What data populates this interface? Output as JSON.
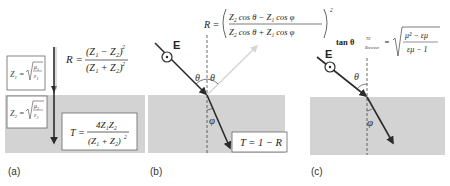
{
  "panels": {
    "a": {
      "label": "(a)",
      "z1_lhs": "Z",
      "z1_sub": "1",
      "z1_num": "μ",
      "z1_num_sub": "1",
      "z1_den": "ε",
      "z1_den_sub": "1",
      "z2_lhs": "Z",
      "z2_sub": "2",
      "z2_num": "μ",
      "z2_num_sub": "2",
      "z2_den": "ε",
      "z2_den_sub": "2",
      "r_lhs": "R =",
      "r_num": "(Z₁ − Z₂)",
      "r_den": "(Z₁ + Z₂)",
      "r_exp": "2",
      "t_lhs": "T =",
      "t_num": "4Z₁Z₂",
      "t_den": "(Z₁ + Z₂)",
      "t_exp": "2"
    },
    "b": {
      "label": "(b)",
      "e_label": "E",
      "theta_left": "θ",
      "theta_right": "θ",
      "phi": "φ",
      "r_lhs": "R =",
      "r_num": "Z₂ cos θ − Z₁ cos φ",
      "r_den": "Z₂ cos θ + Z₁ cos φ",
      "r_exp": "2",
      "t_text": "T = 1 − R"
    },
    "c": {
      "label": "(c)",
      "e_label": "E",
      "theta": "θ",
      "phi": "φ",
      "brewster_lhs": "tan θ",
      "brewster_sup": "TE",
      "brewster_sub": "Brewster",
      "brewster_eq": "=",
      "brewster_num": "μ² − εμ",
      "brewster_den": "εμ − 1"
    }
  },
  "colors": {
    "medium": "#d3d3d3",
    "ray": "#2b2b2b",
    "reflected": "#d0d0d0",
    "box_border": "#555555",
    "dashed": "#444444"
  }
}
